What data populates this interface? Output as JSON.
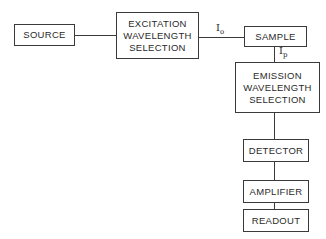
{
  "diagram": {
    "type": "block-diagram",
    "title": "",
    "blocks": {
      "source": {
        "lines": [
          "SOURCE"
        ]
      },
      "excitation": {
        "lines": [
          "EXCITATION",
          "WAVELENGTH",
          "SELECTION"
        ]
      },
      "sample": {
        "lines": [
          "SAMPLE"
        ]
      },
      "emission": {
        "lines": [
          "EMISSION",
          "WAVELENGTH",
          "SELECTION"
        ]
      },
      "detector": {
        "lines": [
          "DETECTOR"
        ]
      },
      "amplifier": {
        "lines": [
          "AMPLIFIER"
        ]
      },
      "readout": {
        "lines": [
          "READOUT"
        ]
      }
    },
    "labels": {
      "io": {
        "main": "I",
        "sub": "o"
      },
      "ip": {
        "main": "I",
        "sub": "p"
      }
    },
    "connections": [
      [
        "SOURCE",
        "EXCITATION WAVELENGTH SELECTION"
      ],
      [
        "EXCITATION WAVELENGTH SELECTION",
        "SAMPLE"
      ],
      [
        "SAMPLE",
        "EMISSION WAVELENGTH SELECTION"
      ],
      [
        "EMISSION WAVELENGTH SELECTION",
        "DETECTOR"
      ],
      [
        "DETECTOR",
        "AMPLIFIER"
      ],
      [
        "AMPLIFIER",
        "READOUT"
      ]
    ]
  }
}
